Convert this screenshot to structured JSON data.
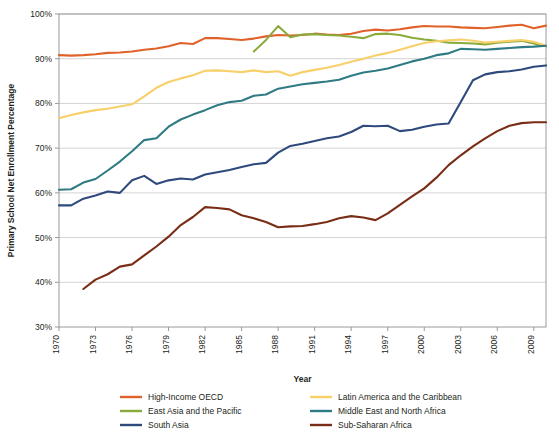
{
  "chart_data": {
    "type": "line",
    "title": "",
    "xlabel": "Year",
    "ylabel": "Primary School Net Enrollment Percentage",
    "xlim": [
      1970,
      2010
    ],
    "ylim": [
      30,
      100
    ],
    "ytick_labels": [
      "30%",
      "40%",
      "50%",
      "60%",
      "70%",
      "80%",
      "90%",
      "100%"
    ],
    "ytick_values": [
      30,
      40,
      50,
      60,
      70,
      80,
      90,
      100
    ],
    "xtick_labels": [
      "1970",
      "1973",
      "1976",
      "1979",
      "1982",
      "1985",
      "1988",
      "1991",
      "1994",
      "1997",
      "2000",
      "2003",
      "2006",
      "2009"
    ],
    "xtick_values": [
      1970,
      1973,
      1976,
      1979,
      1982,
      1985,
      1988,
      1991,
      1994,
      1997,
      2000,
      2003,
      2006,
      2009
    ],
    "grid": "horizontal",
    "legend_position": "bottom",
    "series": [
      {
        "name": "High-Income OECD",
        "color": "#e0622a",
        "x": [
          1970,
          1971,
          1972,
          1973,
          1974,
          1975,
          1976,
          1977,
          1978,
          1979,
          1980,
          1981,
          1982,
          1983,
          1984,
          1985,
          1986,
          1987,
          1988,
          1989,
          1990,
          1991,
          1992,
          1993,
          1994,
          1995,
          1996,
          1997,
          1998,
          1999,
          2000,
          2001,
          2002,
          2003,
          2004,
          2005,
          2006,
          2007,
          2008,
          2009,
          2010
        ],
        "values": [
          90.8,
          90.7,
          90.8,
          91.0,
          91.3,
          91.4,
          91.6,
          92.0,
          92.3,
          92.8,
          93.5,
          93.3,
          94.6,
          94.6,
          94.4,
          94.2,
          94.5,
          95.0,
          95.3,
          95.2,
          95.3,
          95.6,
          95.4,
          95.3,
          95.6,
          96.2,
          96.5,
          96.3,
          96.6,
          97.0,
          97.3,
          97.2,
          97.2,
          97.0,
          96.9,
          96.8,
          97.1,
          97.4,
          97.6,
          96.8,
          97.4
        ]
      },
      {
        "name": "East Asia and the Pacific",
        "color": "#8aab3c",
        "x": [
          1986,
          1987,
          1988,
          1989,
          1990,
          1991,
          1992,
          1993,
          1994,
          1995,
          1996,
          1997,
          1998,
          1999,
          2000,
          2001,
          2002,
          2003,
          2004,
          2005,
          2006,
          2007,
          2008,
          2009,
          2010
        ],
        "values": [
          91.6,
          94.2,
          97.3,
          94.8,
          95.4,
          95.5,
          95.3,
          95.2,
          94.9,
          94.6,
          95.5,
          95.6,
          95.3,
          94.7,
          94.3,
          94.0,
          93.6,
          93.5,
          93.4,
          93.2,
          93.6,
          93.8,
          94.0,
          93.4,
          92.8
        ]
      },
      {
        "name": "South Asia",
        "color": "#2e4a7d",
        "x": [
          1970,
          1971,
          1972,
          1973,
          1974,
          1975,
          1976,
          1977,
          1978,
          1979,
          1980,
          1981,
          1982,
          1983,
          1984,
          1985,
          1986,
          1987,
          1988,
          1989,
          1990,
          1991,
          1992,
          1993,
          1994,
          1995,
          1996,
          1997,
          1998,
          1999,
          2000,
          2001,
          2002,
          2003,
          2004,
          2005,
          2006,
          2007,
          2008,
          2009,
          2010
        ],
        "values": [
          57.2,
          57.2,
          58.7,
          59.4,
          60.3,
          60.0,
          62.8,
          63.8,
          62.0,
          62.8,
          63.2,
          63.0,
          64.1,
          64.6,
          65.1,
          65.8,
          66.4,
          66.7,
          69.0,
          70.5,
          71.0,
          71.6,
          72.2,
          72.6,
          73.6,
          75.0,
          74.9,
          75.0,
          73.8,
          74.1,
          74.8,
          75.3,
          75.5,
          80.3,
          85.2,
          86.5,
          87.0,
          87.2,
          87.6,
          88.2,
          88.5
        ]
      },
      {
        "name": "Latin America and the Caribbean",
        "color": "#f7d06a",
        "x": [
          1970,
          1971,
          1972,
          1973,
          1974,
          1975,
          1976,
          1977,
          1978,
          1979,
          1980,
          1981,
          1982,
          1983,
          1984,
          1985,
          1986,
          1987,
          1988,
          1989,
          1990,
          1991,
          1992,
          1993,
          1994,
          1995,
          1996,
          1997,
          1998,
          1999,
          2000,
          2001,
          2002,
          2003,
          2004,
          2005,
          2006,
          2007,
          2008,
          2009,
          2010
        ],
        "values": [
          76.7,
          77.4,
          78.0,
          78.5,
          78.8,
          79.3,
          79.8,
          81.6,
          83.5,
          84.8,
          85.6,
          86.3,
          87.3,
          87.4,
          87.2,
          87.0,
          87.4,
          87.0,
          87.2,
          86.2,
          87.0,
          87.5,
          88.0,
          88.6,
          89.3,
          90.0,
          90.7,
          91.3,
          92.0,
          92.8,
          93.5,
          93.9,
          94.1,
          94.3,
          94.0,
          93.6,
          93.8,
          94.0,
          94.2,
          93.8,
          92.9
        ]
      },
      {
        "name": "Middle East and North Africa",
        "color": "#2f7b84",
        "x": [
          1970,
          1971,
          1972,
          1973,
          1974,
          1975,
          1976,
          1977,
          1978,
          1979,
          1980,
          1981,
          1982,
          1983,
          1984,
          1985,
          1986,
          1987,
          1988,
          1989,
          1990,
          1991,
          1992,
          1993,
          1994,
          1995,
          1996,
          1997,
          1998,
          1999,
          2000,
          2001,
          2002,
          2003,
          2004,
          2005,
          2006,
          2007,
          2008,
          2009,
          2010
        ],
        "values": [
          60.7,
          60.8,
          62.3,
          63.1,
          65.0,
          67.0,
          69.3,
          71.8,
          72.2,
          74.8,
          76.4,
          77.5,
          78.5,
          79.6,
          80.3,
          80.6,
          81.7,
          82.0,
          83.3,
          83.8,
          84.3,
          84.6,
          84.9,
          85.3,
          86.2,
          86.9,
          87.3,
          87.8,
          88.6,
          89.4,
          90.0,
          90.8,
          91.2,
          92.2,
          92.1,
          92.0,
          92.2,
          92.4,
          92.6,
          92.7,
          92.9
        ]
      },
      {
        "name": "Sub-Saharan Africa",
        "color": "#7a2d16",
        "x": [
          1972,
          1973,
          1974,
          1975,
          1976,
          1977,
          1978,
          1979,
          1980,
          1981,
          1982,
          1983,
          1984,
          1985,
          1986,
          1987,
          1988,
          1989,
          1990,
          1991,
          1992,
          1993,
          1994,
          1995,
          1996,
          1997,
          1998,
          1999,
          2000,
          2001,
          2002,
          2003,
          2004,
          2005,
          2006,
          2007,
          2008,
          2009,
          2010
        ],
        "values": [
          38.5,
          40.6,
          41.8,
          43.5,
          44.0,
          46.0,
          48.0,
          50.2,
          52.8,
          54.6,
          56.8,
          56.6,
          56.3,
          55.0,
          54.3,
          53.5,
          52.3,
          52.5,
          52.6,
          53.0,
          53.5,
          54.3,
          54.8,
          54.5,
          53.9,
          55.4,
          57.3,
          59.2,
          61.0,
          63.4,
          66.2,
          68.4,
          70.4,
          72.2,
          73.8,
          75.0,
          75.6,
          75.8,
          75.8
        ]
      }
    ],
    "legend_order": [
      [
        "High-Income OECD",
        "Latin America and the Caribbean"
      ],
      [
        "East Asia and the Pacific",
        "Middle East and North Africa"
      ],
      [
        "South Asia",
        "Sub-Saharan Africa"
      ]
    ]
  }
}
